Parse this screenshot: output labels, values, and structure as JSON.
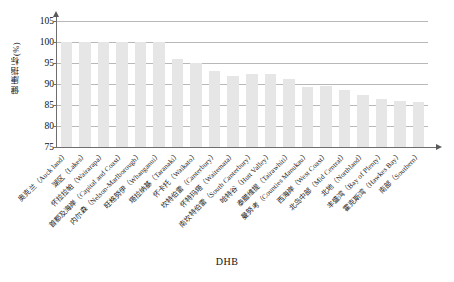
{
  "chart_data": {
    "type": "bar",
    "title": "",
    "subtitle": "",
    "xlabel": "DHB",
    "ylabel": "健康指标(%)",
    "ylim": [
      75,
      105
    ],
    "yticks": [
      75,
      80,
      85,
      90,
      95,
      100,
      105
    ],
    "ytick_labels": [
      "75",
      "80",
      "85",
      "90",
      "95",
      "100",
      "105"
    ],
    "grid": true,
    "grid_axis": "y",
    "legend": false,
    "legend_position": "none",
    "bar_color": "#e6e6e6",
    "categories": [
      "奥克兰（Auck land）",
      "湖区（Lakes）",
      "怀拉拉帕（Wairarapa）",
      "首都及海岸（Capital and Coast）",
      "内尔森（Nelson-Marlborough）",
      "旺格努伊（Whanganui）",
      "塔拉纳基（Taranaki）",
      "怀卡托（Waikato）",
      "坎特伯雷（Canterbury）",
      "怀特玛塔（Waitemata）",
      "南坎特伯雷（South Canterbury）",
      "哈特谷（Hutt Valley）",
      "泰腊维提（Tairawhiti）",
      "曼努考（Counties Manukau）",
      "西海岸（West Coast）",
      "北岛中部（Mid Central）",
      "北地（Northland）",
      "丰盛湾（Bay of Plenty）",
      "霍克斯湾（Hawkes Bay）",
      "南部（Southern）"
    ],
    "values": [
      100,
      100,
      100,
      100,
      100,
      100,
      96,
      95,
      93.2,
      92,
      92.3,
      92.3,
      91.2,
      89.4,
      89.5,
      88.5,
      87.5,
      86.5,
      86,
      85.8
    ]
  },
  "axes": {
    "y_title": "健康指标(%)",
    "x_title": "DHB"
  }
}
